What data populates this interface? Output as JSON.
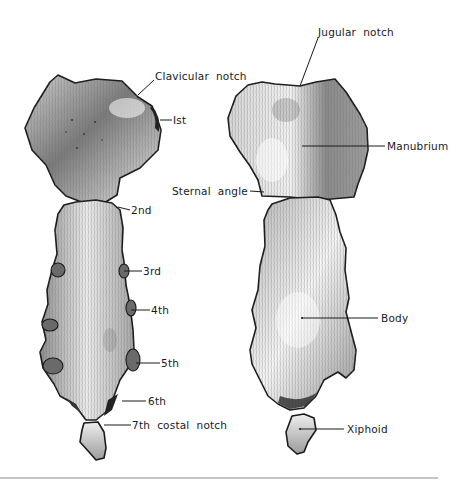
{
  "figure": {
    "views": [
      "lateral-oblique view with costal notches",
      "anterior view"
    ],
    "left_view": {
      "labels": [
        {
          "id": "clavicular-notch",
          "text": "Clavicular  notch"
        },
        {
          "id": "1st",
          "text": "Ist"
        },
        {
          "id": "2nd",
          "text": "2nd"
        },
        {
          "id": "3rd",
          "text": "3rd"
        },
        {
          "id": "4th",
          "text": "4th"
        },
        {
          "id": "5th",
          "text": "5th"
        },
        {
          "id": "6th",
          "text": "6th"
        },
        {
          "id": "7th",
          "text": "7th  costal  notch"
        }
      ]
    },
    "right_view": {
      "labels": [
        {
          "id": "jugular-notch",
          "text": "Jugular  notch"
        },
        {
          "id": "manubrium",
          "text": "Manubrium"
        },
        {
          "id": "sternal-angle",
          "text": "Sternal  angle"
        },
        {
          "id": "body",
          "text": "Body"
        },
        {
          "id": "xiphoid",
          "text": "Xiphoid"
        }
      ]
    },
    "colors": {
      "ink": "#1a1a1a",
      "bone_light": "#f2f2f2",
      "bone_mid": "#bdbdbd",
      "bone_dark": "#6a6a6a",
      "rule": "#8c8c8c"
    }
  }
}
